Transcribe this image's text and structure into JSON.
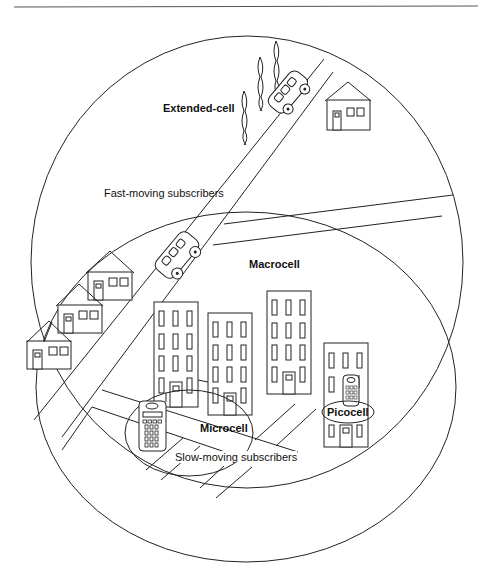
{
  "diagram": {
    "labels": {
      "extended_cell": "Extended-cell",
      "fast_moving": "Fast-moving subscribers",
      "macrocell": "Macrocell",
      "microcell": "Microcell",
      "slow_moving": "Slow-moving subscribers",
      "picocell": "Picocell"
    },
    "elements": {
      "houses": 4,
      "office_buildings": 4,
      "vehicles": 2,
      "handsets": 2,
      "trees": 3
    },
    "colors": {
      "line": "#222222",
      "background": "#ffffff"
    }
  }
}
